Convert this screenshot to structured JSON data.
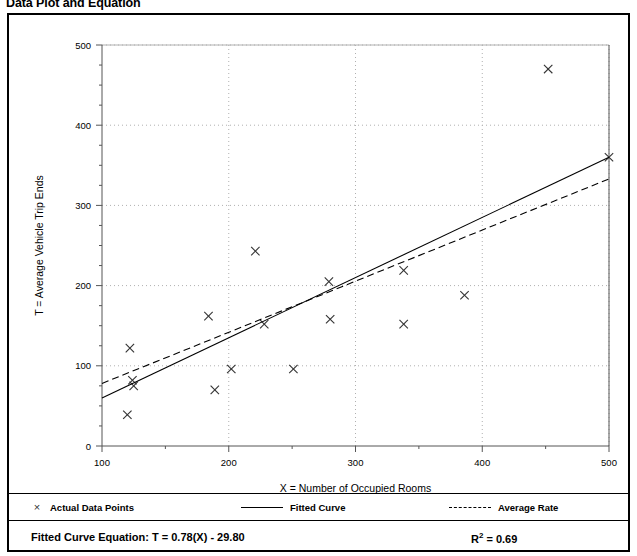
{
  "page": {
    "title": "Data Plot and Equation"
  },
  "legend": {
    "points_label": "Actual Data Points",
    "points_marker": "x-marker-icon",
    "fitted_label": "Fitted Curve",
    "fitted_marker": "solid-line-icon",
    "average_label": "Average Rate",
    "average_marker": "dashed-line-icon"
  },
  "equation": {
    "label": "Fitted Curve Equation:  T = 0.78(X) - 29.80",
    "r2_prefix": "R",
    "r2_sup": "2",
    "r2_value": " = 0.69"
  },
  "colors": {
    "ink": "#000000",
    "grid": "#b0b0b0",
    "axis": "#555555",
    "marker": "#333333"
  },
  "chart_data": {
    "type": "scatter",
    "title": "Data Plot and Equation",
    "xlabel": "X = Number of Occupied Rooms",
    "ylabel": "T = Average Vehicle Trip Ends",
    "xlim": [
      100,
      500
    ],
    "ylim": [
      0,
      500
    ],
    "xticks": [
      100,
      200,
      300,
      400,
      500
    ],
    "yticks": [
      0,
      100,
      200,
      300,
      400,
      500
    ],
    "xminor_step": 50,
    "yminor_step": 25,
    "grid": true,
    "legend_position": "below-plot",
    "series": [
      {
        "name": "Actual Data Points",
        "type": "scatter",
        "marker": "x",
        "points": [
          [
            120,
            39
          ],
          [
            122,
            122
          ],
          [
            124,
            82
          ],
          [
            125,
            75
          ],
          [
            184,
            162
          ],
          [
            189,
            70
          ],
          [
            202,
            96
          ],
          [
            221,
            243
          ],
          [
            228,
            152
          ],
          [
            251,
            96
          ],
          [
            279,
            205
          ],
          [
            280,
            158
          ],
          [
            338,
            219
          ],
          [
            338,
            152
          ],
          [
            386,
            188
          ],
          [
            452,
            470
          ],
          [
            500,
            360
          ]
        ]
      },
      {
        "name": "Fitted Curve",
        "type": "line",
        "style": "solid",
        "equation": "T = 0.78(X) - 29.80",
        "slope": 0.78,
        "intercept": -29.8,
        "r_squared": 0.69,
        "endpoints": [
          [
            100,
            60
          ],
          [
            500,
            360
          ]
        ]
      },
      {
        "name": "Average Rate",
        "type": "line",
        "style": "dashed",
        "endpoints": [
          [
            100,
            78
          ],
          [
            500,
            333
          ]
        ]
      }
    ]
  }
}
